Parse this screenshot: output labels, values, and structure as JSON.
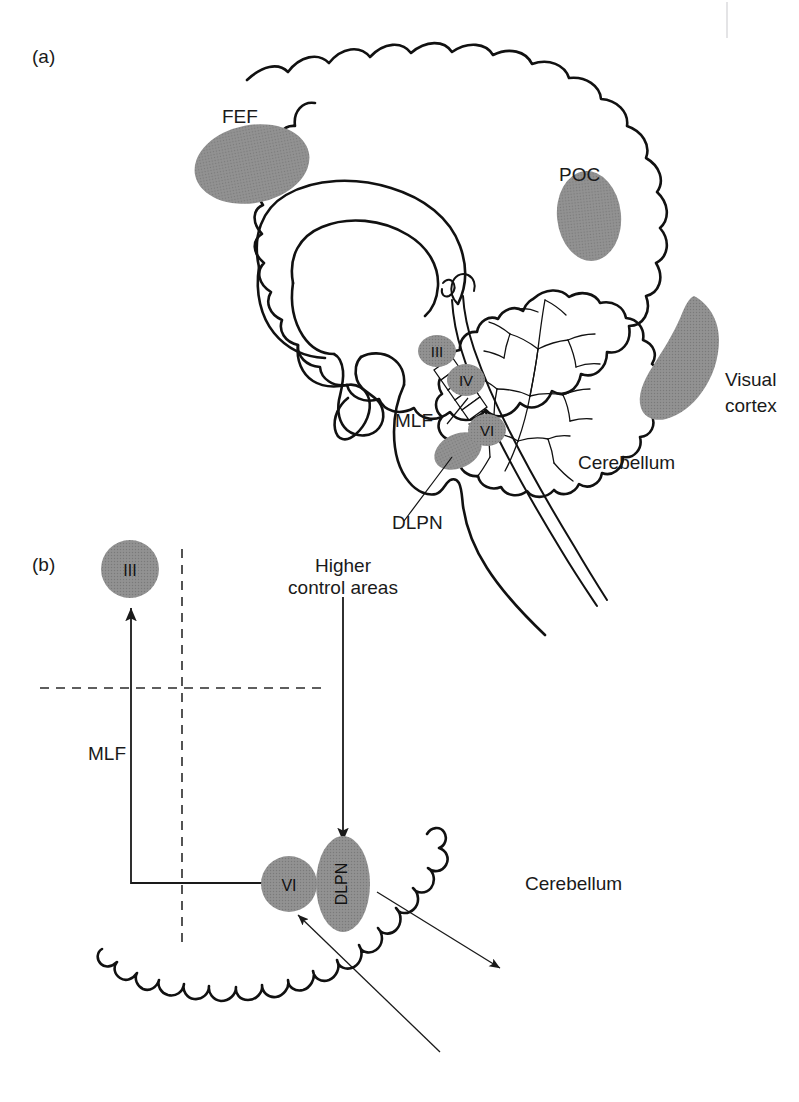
{
  "figure": {
    "background_color": "#ffffff",
    "ink_color": "#111111",
    "nucleus_fill_color": "#8a8a8a",
    "region_fill_color": "#8a8a8a"
  },
  "panels": [
    {
      "id": "a",
      "label": "(a)",
      "type": "sagittal-brain-schematic",
      "labels": {
        "fef": "FEF",
        "poc": "POC",
        "visual_cortex_line1": "Visual",
        "visual_cortex_line2": "cortex",
        "cerebellum": "Cerebellum",
        "mlf": "MLF",
        "dlpn": "DLPN"
      },
      "nuclei": [
        {
          "id": "iii",
          "label": "III"
        },
        {
          "id": "iv",
          "label": "IV"
        },
        {
          "id": "vi",
          "label": "VI"
        }
      ],
      "shaded_regions": [
        {
          "id": "fef",
          "label": "FEF",
          "shape": "ellipse"
        },
        {
          "id": "poc",
          "label": "POC",
          "shape": "ellipse"
        },
        {
          "id": "visual-cortex",
          "label": "Visual cortex",
          "shape": "crescent"
        },
        {
          "id": "dlpn",
          "label": "DLPN",
          "shape": "ellipse"
        }
      ]
    },
    {
      "id": "b",
      "label": "(b)",
      "type": "brainstem-circuit-diagram",
      "labels": {
        "mlf": "MLF",
        "higher_control_line1": "Higher",
        "higher_control_line2": "control areas",
        "cerebellum": "Cerebellum"
      },
      "nuclei": [
        {
          "id": "iii",
          "label": "III",
          "shape": "circle"
        },
        {
          "id": "vi",
          "label": "VI",
          "shape": "circle"
        },
        {
          "id": "dlpn",
          "label": "DLPN",
          "shape": "ellipse",
          "text_orientation": "vertical"
        }
      ],
      "connections": [
        {
          "id": "higher-to-dlpn",
          "from": "Higher control areas",
          "to": "DLPN",
          "arrow": true
        },
        {
          "id": "vi-to-iii-mlf",
          "from": "VI",
          "to": "III",
          "via": "MLF",
          "arrow": true
        },
        {
          "id": "dlpn-to-cerebellum",
          "from": "DLPN",
          "to": "Cerebellum",
          "arrow": true
        },
        {
          "id": "cerebellum-to-vi",
          "from": "Cerebellum",
          "to": "VI",
          "arrow": true
        }
      ],
      "midline_guides": [
        {
          "id": "vertical-midline",
          "style": "dashed",
          "orientation": "vertical"
        },
        {
          "id": "horizontal-midline",
          "style": "dashed",
          "orientation": "horizontal"
        }
      ]
    }
  ]
}
